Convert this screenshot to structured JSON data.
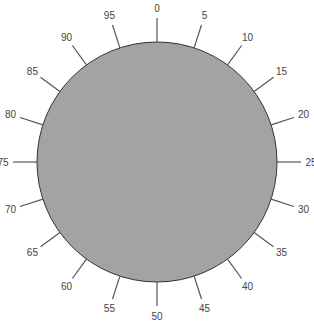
{
  "dial": {
    "center": [
      157,
      162
    ],
    "radius": 120,
    "fill_color": "#a3a3a3",
    "stroke_color": "#333333",
    "tick_color": "#555555",
    "ticks": [
      "0",
      "5",
      "10",
      "15",
      "20",
      "25",
      "30",
      "35",
      "40",
      "45",
      "50",
      "55",
      "60",
      "65",
      "70",
      "75",
      "80",
      "85",
      "90",
      "95"
    ]
  }
}
